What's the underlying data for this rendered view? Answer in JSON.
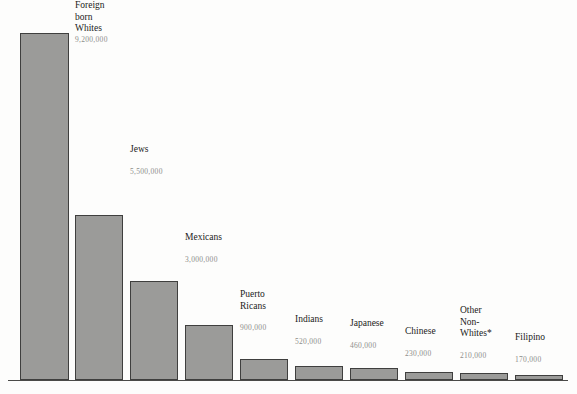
{
  "chart_data": {
    "type": "bar",
    "title": "",
    "subtitle": "",
    "xlabel": "",
    "ylabel": "",
    "grid": false,
    "legend": "none",
    "ylim": [
      0,
      18800000
    ],
    "categories": [
      "Blacks",
      "Foreign born Whites",
      "Jews",
      "Mexicans",
      "Puerto Ricans",
      "Indians",
      "Japanese",
      "Chinese",
      "Other Non-Whites*",
      "Filipino"
    ],
    "values": [
      18800000,
      9200000,
      5500000,
      3000000,
      900000,
      520000,
      460000,
      230000,
      210000,
      170000
    ],
    "value_labels": [
      "18,800,000",
      "9,200,000",
      "5,500,000",
      "3,000,000",
      "900,000",
      "520,000",
      "460,000",
      "230,000",
      "210,000",
      "170,000"
    ]
  },
  "bars": [
    {
      "label": "Blacks",
      "value_label": "18,800,000",
      "x": 20,
      "width": 49,
      "height": 347,
      "label_lines": "Blacks",
      "label_top": -386,
      "value_top": -362
    },
    {
      "label": "Foreign born Whites",
      "value_label": "9,200,000",
      "x": 75,
      "width": 48,
      "height": 165,
      "label_lines": "Foreign\nborn\nWhites",
      "label_top": -215,
      "value_top": -180
    },
    {
      "label": "Jews",
      "value_label": "5,500,000",
      "x": 130,
      "width": 48,
      "height": 99,
      "label_lines": "Jews",
      "label_top": -137,
      "value_top": -114
    },
    {
      "label": "Mexicans",
      "value_label": "3,000,000",
      "x": 185,
      "width": 48,
      "height": 55,
      "label_lines": "Mexicans",
      "label_top": -93,
      "value_top": -70
    },
    {
      "label": "Puerto Ricans",
      "value_label": "900,000",
      "x": 240,
      "width": 48,
      "height": 21,
      "label_lines": "Puerto\nRicans",
      "label_top": -70,
      "value_top": -36
    },
    {
      "label": "Indians",
      "value_label": "520,000",
      "x": 295,
      "width": 48,
      "height": 14,
      "label_lines": "Indians",
      "label_top": -52,
      "value_top": -29
    },
    {
      "label": "Japanese",
      "value_label": "460,000",
      "x": 350,
      "width": 48,
      "height": 12,
      "label_lines": "Japanese",
      "label_top": -50,
      "value_top": -27
    },
    {
      "label": "Chinese",
      "value_label": "230,000",
      "x": 405,
      "width": 48,
      "height": 8,
      "label_lines": "Chinese",
      "label_top": -46,
      "value_top": -23
    },
    {
      "label": "Other Non-Whites*",
      "value_label": "210,000",
      "x": 460,
      "width": 48,
      "height": 7,
      "label_lines": "Other\nNon-\nWhites*",
      "label_top": -68,
      "value_top": -22
    },
    {
      "label": "Filipino",
      "value_label": "170,000",
      "x": 515,
      "width": 48,
      "height": 5,
      "label_lines": "Filipino",
      "label_top": -43,
      "value_top": -20
    }
  ],
  "style": {
    "bar_fill": "#9b9b99",
    "bar_border": "#3f3f3e",
    "axis_color": "#4a4a48",
    "label_color": "#1b1b1a",
    "value_color": "#8d8d8b",
    "background": "#fdfdfc"
  }
}
